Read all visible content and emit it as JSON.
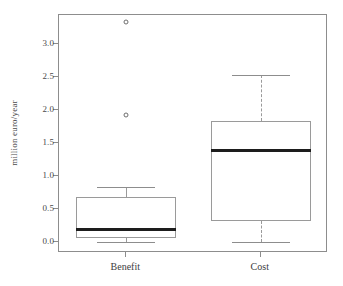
{
  "chart_data": {
    "type": "box",
    "title": "",
    "xlabel": "",
    "ylabel": "million euro/year",
    "categories": [
      "Benefit",
      "Cost"
    ],
    "ylim": [
      -0.17,
      3.44
    ],
    "yticks": [
      0.0,
      0.5,
      1.0,
      1.5,
      2.0,
      2.5,
      3.0
    ],
    "ytick_labels": [
      "0.0",
      "0.5",
      "1.0",
      "1.5",
      "2.0",
      "2.5",
      "3.0"
    ],
    "grid": false,
    "legend": false,
    "boxes": [
      {
        "name": "Benefit",
        "whisker_low": 0.0,
        "q1": 0.05,
        "median": 0.18,
        "q3": 0.68,
        "whisker_high": 0.83,
        "outliers": [
          1.92,
          3.33
        ],
        "whisker_style": "solid"
      },
      {
        "name": "Cost",
        "whisker_low": 0.0,
        "q1": 0.32,
        "median": 1.39,
        "q3": 1.83,
        "whisker_high": 2.53,
        "outliers": [],
        "whisker_style": "dashed"
      }
    ]
  },
  "colors": {
    "frame": "#8d8d8d",
    "box_outline": "#9a9a9a",
    "median": "#1d1d1d",
    "whisker": "#9a9a9a",
    "outlier": "#6e6e6e",
    "tick_text": "#4a4a4a",
    "axis_text": "#3d3d3d",
    "background": "#ffffff"
  }
}
